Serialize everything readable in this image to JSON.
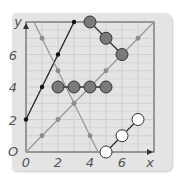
{
  "chart_data": {
    "type": "scatter",
    "title": "",
    "xlabel": "x",
    "ylabel": "y",
    "xlim": [
      0,
      8
    ],
    "ylim": [
      0,
      8
    ],
    "grid": true,
    "x_ticks": [
      "0",
      "2",
      "4",
      "6"
    ],
    "y_ticks": [
      "0",
      "2",
      "4",
      "6"
    ],
    "origin_label": "O",
    "series": [
      {
        "name": "black line y=2x+2",
        "style": "line-small-black-dots",
        "color": "#222222",
        "points": [
          [
            0,
            2
          ],
          [
            1,
            4
          ],
          [
            2,
            6
          ],
          [
            3,
            8
          ]
        ]
      },
      {
        "name": "grey line y=x",
        "style": "line-small-grey-dots",
        "color": "#9a9a9a",
        "points": [
          [
            0,
            0
          ],
          [
            1,
            1
          ],
          [
            2,
            2
          ],
          [
            3,
            3
          ],
          [
            4,
            4
          ],
          [
            5,
            5
          ],
          [
            6,
            6
          ],
          [
            7,
            7
          ],
          [
            8,
            8
          ]
        ]
      },
      {
        "name": "grey line y=-2x+9",
        "style": "line-small-grey-dots",
        "color": "#9a9a9a",
        "points": [
          [
            0.5,
            8
          ],
          [
            1,
            7
          ],
          [
            2,
            5
          ],
          [
            3,
            3
          ],
          [
            4,
            1
          ],
          [
            4.5,
            0
          ]
        ]
      },
      {
        "name": "large grey circles row",
        "style": "large-grey-circles",
        "color": "#7a7a7a",
        "points": [
          [
            2,
            4
          ],
          [
            3,
            4
          ],
          [
            4,
            4
          ],
          [
            5,
            4
          ]
        ]
      },
      {
        "name": "large grey circles diagonal",
        "style": "large-grey-circles",
        "color": "#7a7a7a",
        "points": [
          [
            4,
            8
          ],
          [
            5,
            7
          ],
          [
            6,
            6
          ]
        ]
      },
      {
        "name": "large white circles",
        "style": "large-white-circles",
        "color": "#ffffff",
        "points": [
          [
            5,
            0
          ],
          [
            6,
            1
          ],
          [
            7,
            2
          ]
        ]
      }
    ]
  }
}
